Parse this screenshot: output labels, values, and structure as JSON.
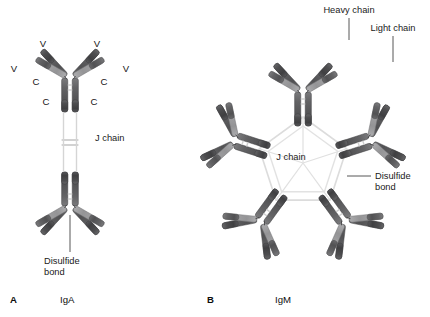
{
  "figure": {
    "background": "#ffffff",
    "panels": [
      {
        "id": "A",
        "panel_letter": "A",
        "title": "IgA",
        "description": "Dimeric immunoglobulin A with two antibody monomers joined tail-to-tail by a J chain",
        "annotations": [
          {
            "name": "v-region-outer-left",
            "text": "V"
          },
          {
            "name": "v-region-inner-left",
            "text": "V"
          },
          {
            "name": "v-region-inner-right",
            "text": "V"
          },
          {
            "name": "v-region-outer-right",
            "text": "V"
          },
          {
            "name": "c-region-light-left",
            "text": "C"
          },
          {
            "name": "c-region-light-right",
            "text": "C"
          },
          {
            "name": "c-region-heavy-left",
            "text": "C"
          },
          {
            "name": "c-region-heavy-right",
            "text": "C"
          },
          {
            "name": "j-chain",
            "text": "J chain"
          },
          {
            "name": "disulfide-bond",
            "text": "Disulfide\nbond",
            "line1": "Disulfide",
            "line2": "bond"
          }
        ]
      },
      {
        "id": "B",
        "panel_letter": "B",
        "title": "IgM",
        "description": "Pentameric immunoglobulin M: five antibody monomers arranged radially around a central J chain",
        "annotations": [
          {
            "name": "heavy-chain",
            "text": "Heavy chain"
          },
          {
            "name": "light-chain",
            "text": "Light chain"
          },
          {
            "name": "j-chain",
            "text": "J chain"
          },
          {
            "name": "disulfide-bond",
            "text": "Disulfide\nbond",
            "line1": "Disulfide",
            "line2": "bond"
          }
        ]
      }
    ]
  },
  "colors": {
    "heavy_chain_dark": "#59595b",
    "heavy_chain_mid": "#6e6e70",
    "light_chain_light": "#a6a6a8",
    "light_chain_mid": "#8d8d8f",
    "constant_dark": "#4f4f51",
    "j_chain_line": "#d2d2d2",
    "disulfide_line": "#c9c9c9",
    "outline": "#3a3a3a",
    "text": "#1a1a1a",
    "background": "#ffffff"
  },
  "legend_keys": {
    "v_region": "V",
    "c_region": "C",
    "heavy_chain": "Heavy chain",
    "light_chain": "Light chain",
    "j_chain": "J chain",
    "disulfide_bond": "Disulfide bond"
  }
}
